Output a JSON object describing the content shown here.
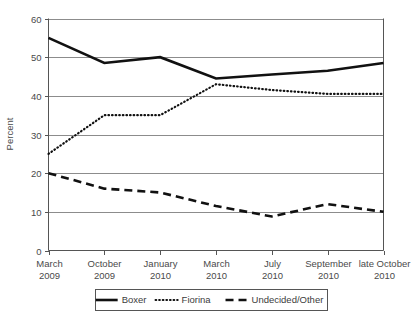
{
  "chart_data": {
    "type": "line",
    "title": "",
    "xlabel": "",
    "ylabel": "Percent",
    "ylim": [
      0,
      60
    ],
    "yticks": [
      0,
      10,
      20,
      30,
      40,
      50,
      60
    ],
    "ytick_labels": [
      "0",
      "10",
      "20",
      "30",
      "40",
      "50",
      "60"
    ],
    "grid": true,
    "legend_position": "bottom",
    "categories": [
      "March 2009",
      "October 2009",
      "January 2010",
      "March 2010",
      "July 2010",
      "September 2010",
      "late October 2010"
    ],
    "xtick_labels": [
      {
        "line1": "March",
        "line2": "2009"
      },
      {
        "line1": "October",
        "line2": "2009"
      },
      {
        "line1": "January",
        "line2": "2010"
      },
      {
        "line1": "March",
        "line2": "2010"
      },
      {
        "line1": "July",
        "line2": "2010"
      },
      {
        "line1": "September",
        "line2": "2010"
      },
      {
        "line1": "late October",
        "line2": "2010"
      }
    ],
    "series": [
      {
        "name": "Boxer",
        "style": "solid",
        "values": [
          55,
          48.5,
          50,
          44.5,
          45.5,
          46.5,
          48.5
        ]
      },
      {
        "name": "Fiorina",
        "style": "dotted",
        "values": [
          25,
          35,
          35,
          43,
          41.5,
          40.5,
          40.5
        ]
      },
      {
        "name": "Undecided/Other",
        "style": "dashed",
        "values": [
          20,
          16,
          15,
          11.5,
          8.8,
          12,
          10
        ]
      }
    ]
  },
  "legend": {
    "items": [
      {
        "label": "Boxer",
        "style": "solid"
      },
      {
        "label": "Fiorina",
        "style": "dotted"
      },
      {
        "label": "Undecided/Other",
        "style": "dashed"
      }
    ]
  },
  "colors": {
    "series_ink": "#111111",
    "grid": "#8c8c8c",
    "axis": "#555555",
    "text": "#4a4a4a",
    "background": "#ffffff"
  }
}
